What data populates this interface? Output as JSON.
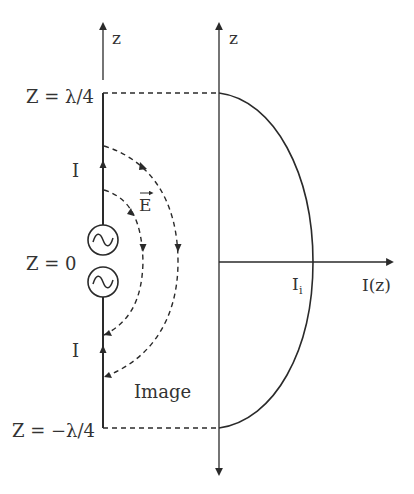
{
  "diagram": {
    "left_axis_label": "z",
    "right_axis_label": "z",
    "horizontal_axis_label": "I(z)",
    "top_level_label": "Z = λ/4",
    "center_level_label": "Z = 0",
    "bottom_level_label": "Z = −λ/4",
    "current_label_upper": "I",
    "current_label_lower": "I",
    "field_label": "E",
    "image_label": "Image",
    "current_peak_label_main": "I",
    "current_peak_label_sub": "i",
    "colors": {
      "stroke": "#2a2a2a",
      "text": "#333333",
      "background": "#ffffff"
    }
  }
}
